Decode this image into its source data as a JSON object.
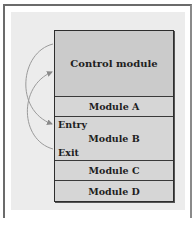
{
  "diagram": {
    "modules": {
      "control": "Control module",
      "a": "Module A",
      "b": "Module B",
      "c": "Module C",
      "d": "Module D"
    },
    "module_b_labels": {
      "entry": "Entry",
      "exit": "Exit"
    },
    "arrows": [
      {
        "from": "Control module",
        "to": "Module B Entry",
        "label": "call"
      },
      {
        "from": "Module B Exit",
        "to": "Control module",
        "label": "return"
      }
    ],
    "colors": {
      "panel_bg": "#ececec",
      "control_fill": "#cbcbcb",
      "module_fill": "#d6d6d6",
      "border": "#2e2e2e",
      "arrow": "#8a8a8a"
    }
  }
}
